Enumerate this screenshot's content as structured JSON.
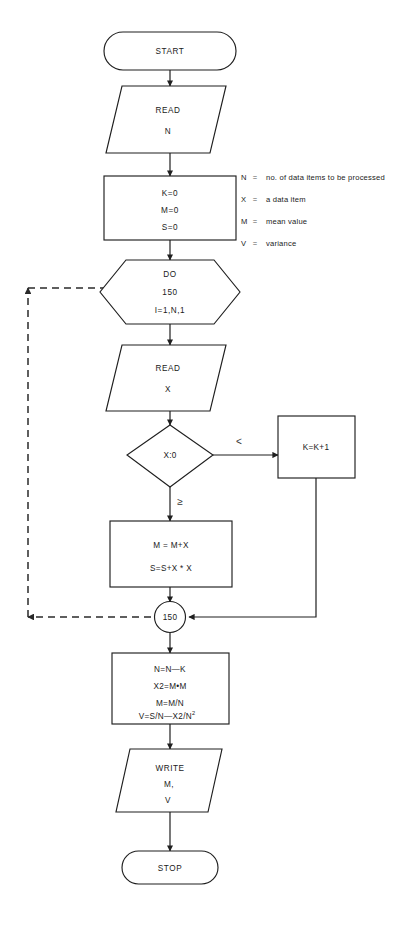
{
  "diagram": {
    "background_color": "#ffffff",
    "line_color": "#1f1f1f"
  },
  "nodes": {
    "start": {
      "label": "START",
      "shape": "terminator"
    },
    "read_n": {
      "line1": "READ",
      "line2": "N",
      "shape": "parallelogram"
    },
    "init": {
      "line1": "K=0",
      "line2": "M=0",
      "line3": "S=0",
      "shape": "process"
    },
    "do_loop": {
      "line1": "DO",
      "line2": "150",
      "line3": "I=1,N,1",
      "shape": "hexagon"
    },
    "read_x": {
      "line1": "READ",
      "line2": "X",
      "shape": "parallelogram"
    },
    "decision": {
      "label": "X:0",
      "shape": "diamond"
    },
    "count_k": {
      "label": "K=K+1",
      "shape": "process"
    },
    "accumulate": {
      "line1": "M = M+X",
      "line2": "S=S+X * X",
      "shape": "process"
    },
    "connector_150": {
      "label": "150",
      "shape": "connector"
    },
    "compute": {
      "line1": "N=N—K",
      "line2": "X2=M•M",
      "line3": "M=M/N",
      "line4_base": "V=S/N—X2/N",
      "line4_sup": "2",
      "shape": "process"
    },
    "write": {
      "line1": "WRITE",
      "line2": "M,",
      "line3": "V",
      "shape": "parallelogram"
    },
    "stop": {
      "label": "STOP",
      "shape": "terminator"
    }
  },
  "branch_labels": {
    "less_than": "<",
    "greater_equal": "≥"
  },
  "legend": {
    "rows": [
      {
        "key": "N",
        "eq": "=",
        "value": "no. of data items to be processed"
      },
      {
        "key": "X",
        "eq": "=",
        "value": "a data item"
      },
      {
        "key": "M",
        "eq": "=",
        "value": "mean value"
      },
      {
        "key": "V",
        "eq": "=",
        "value": "variance"
      }
    ]
  }
}
